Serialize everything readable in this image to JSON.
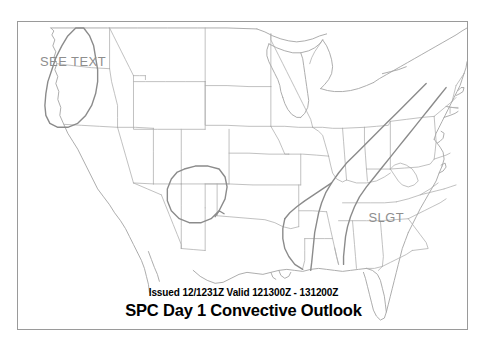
{
  "product": {
    "issued_line": "Issued 12/1231Z Valid 121300Z - 131200Z",
    "title_line": "SPC Day 1 Convective Outlook"
  },
  "map": {
    "background_color": "#ffffff",
    "frame_color": "#9a9a9a",
    "state_border_color": "#a8a8a8",
    "coastline_color": "#a0a0a0",
    "outlook_line_color": "#8a8a8a"
  },
  "risk_labels": [
    {
      "text": "SEE TEXT",
      "x": 22,
      "y": 44,
      "color": "#8e8e8e",
      "region": "pacific-northwest"
    },
    {
      "text": "SLGT",
      "x": 352,
      "y": 201,
      "color": "#8e8e8e",
      "region": "southeast"
    }
  ],
  "outlook_areas": [
    {
      "name": "see-text-pacific-northwest",
      "category": "SEE TEXT"
    },
    {
      "name": "slgt-southern-plains",
      "category": "SLGT"
    },
    {
      "name": "slgt-southeast-corridor",
      "category": "SLGT"
    }
  ]
}
